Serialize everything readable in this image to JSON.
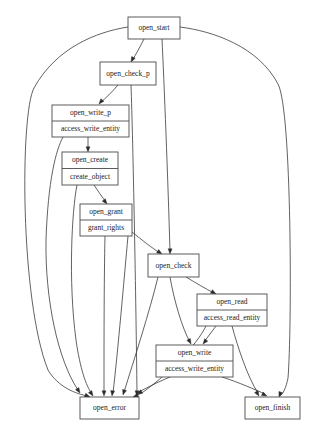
{
  "diagram": {
    "type": "directed-graph",
    "background_color": "#ffffff",
    "edge_color": "#3a3a3a",
    "node_border_color": "#4a4a4a",
    "node_fill_color": "#ffffff",
    "text_color": "#1a1a1a"
  },
  "nodes": [
    {
      "id": "open_start",
      "name": "open_start",
      "rows": [
        "open_start"
      ],
      "x": 128,
      "y": 17,
      "w": 52,
      "h": 22,
      "font_size": 7.5
    },
    {
      "id": "open_check_p",
      "name": "open_check_p",
      "rows": [
        "open_check_p"
      ],
      "x": 100,
      "y": 62,
      "w": 56,
      "h": 23,
      "font_size": 7.5
    },
    {
      "id": "open_write_p",
      "name": "open_write_p",
      "rows": [
        "open_write_p",
        "access_write_entity"
      ],
      "x": 52,
      "y": 105,
      "w": 77,
      "h": 32,
      "font_size": 7.5
    },
    {
      "id": "open_create",
      "name": "open_create",
      "rows": [
        "open_create",
        "create_object"
      ],
      "x": 62,
      "y": 152,
      "w": 56,
      "h": 33,
      "font_size": 7.5
    },
    {
      "id": "open_grant",
      "name": "open_grant",
      "rows": [
        "open_grant",
        "grant_rights"
      ],
      "x": 80,
      "y": 204,
      "w": 52,
      "h": 32,
      "font_size": 7.5
    },
    {
      "id": "open_check",
      "name": "open_check",
      "rows": [
        "open_check"
      ],
      "x": 148,
      "y": 254,
      "w": 51,
      "h": 23,
      "font_size": 7.5
    },
    {
      "id": "open_read",
      "name": "open_read",
      "rows": [
        "open_read",
        "access_read_entity"
      ],
      "x": 197,
      "y": 294,
      "w": 70,
      "h": 32,
      "font_size": 7.5
    },
    {
      "id": "open_write",
      "name": "open_write",
      "rows": [
        "open_write",
        "access_write_entity"
      ],
      "x": 156,
      "y": 345,
      "w": 77,
      "h": 32,
      "font_size": 7.5
    },
    {
      "id": "open_error",
      "name": "open_error",
      "rows": [
        "open_error"
      ],
      "x": 80,
      "y": 397,
      "w": 59,
      "h": 22,
      "font_size": 7.5
    },
    {
      "id": "open_finish",
      "name": "open_finish",
      "rows": [
        "open_finish"
      ],
      "x": 245,
      "y": 397,
      "w": 55,
      "h": 22,
      "font_size": 7.5
    }
  ],
  "edges": [
    {
      "from": "open_start",
      "to": "open_check_p",
      "path": "M 144,39 C 140,47 136,54 132,61",
      "arrow": {
        "x": 131,
        "y": 62,
        "angle": 118
      }
    },
    {
      "from": "open_start",
      "to": "open_error",
      "path": "M 128,27 C 96,32 56,48 34,88 C 20,114 20,300 48,370 C 58,387 76,394 88,396",
      "arrow": {
        "x": 90,
        "y": 397,
        "angle": 20
      }
    },
    {
      "from": "open_start",
      "to": "open_finish",
      "path": "M 180,27 C 212,31 258,46 278,84 C 292,110 292,330 288,378 C 286,388 283,394 280,396",
      "arrow": {
        "x": 279,
        "y": 397,
        "angle": 110
      }
    },
    {
      "from": "open_start",
      "to": "open_check",
      "path": "M 162,39 C 164,80 168,180 170,252",
      "arrow": {
        "x": 170,
        "y": 254,
        "angle": 91
      }
    },
    {
      "from": "open_check_p",
      "to": "open_write_p",
      "path": "M 118,85 C 112,92 106,98 100,103",
      "arrow": {
        "x": 99,
        "y": 104,
        "angle": 130
      }
    },
    {
      "from": "open_check_p",
      "to": "open_error",
      "path": "M 131,85 C 133,140 136,300 137,394",
      "arrow": {
        "x": 137,
        "y": 396,
        "angle": 90
      }
    },
    {
      "from": "open_write_p",
      "to": "open_create",
      "path": "M 88,137 C 88,142 88,146 88,150",
      "arrow": {
        "x": 88,
        "y": 152,
        "angle": 90
      }
    },
    {
      "from": "open_write_p",
      "to": "open_error",
      "path": "M 63,137 C 56,150 48,180 46,240 C 45,300 58,360 78,390",
      "arrow": {
        "x": 80,
        "y": 393,
        "angle": 57
      }
    },
    {
      "from": "open_create",
      "to": "open_grant",
      "path": "M 94,185 C 98,191 102,197 106,202",
      "arrow": {
        "x": 107,
        "y": 204,
        "angle": 52
      }
    },
    {
      "from": "open_create",
      "to": "open_error",
      "path": "M 77,185 C 72,210 68,280 76,340 C 80,368 86,386 92,394",
      "arrow": {
        "x": 93,
        "y": 396,
        "angle": 56
      }
    },
    {
      "from": "open_grant",
      "to": "open_check",
      "path": "M 132,232 C 142,240 152,248 160,253",
      "arrow": {
        "x": 162,
        "y": 254,
        "angle": 33
      }
    },
    {
      "from": "open_grant",
      "to": "open_error",
      "path": "M 105,236 C 104,280 104,350 104,393",
      "arrow": {
        "x": 104,
        "y": 396,
        "angle": 90
      }
    },
    {
      "from": "open_grant",
      "to": "open_error",
      "path": "M 128,236 C 124,280 118,350 113,393",
      "arrow": {
        "x": 112,
        "y": 396,
        "angle": 97
      }
    },
    {
      "from": "open_check",
      "to": "open_read",
      "path": "M 186,277 C 196,283 206,289 214,293",
      "arrow": {
        "x": 216,
        "y": 294,
        "angle": 30
      }
    },
    {
      "from": "open_check",
      "to": "open_write",
      "path": "M 170,277 C 174,300 182,328 190,342",
      "arrow": {
        "x": 191,
        "y": 344,
        "angle": 62
      }
    },
    {
      "from": "open_check",
      "to": "open_error",
      "path": "M 158,277 C 150,310 134,360 124,392",
      "arrow": {
        "x": 123,
        "y": 395,
        "angle": 107
      }
    },
    {
      "from": "open_read",
      "to": "open_write",
      "path": "M 216,326 C 212,331 208,337 204,342",
      "arrow": {
        "x": 203,
        "y": 344,
        "angle": 128
      }
    },
    {
      "from": "open_read",
      "to": "open_finish",
      "path": "M 232,326 C 238,348 248,378 258,393",
      "arrow": {
        "x": 259,
        "y": 396,
        "angle": 58
      }
    },
    {
      "from": "open_read",
      "to": "open_error",
      "path": "M 206,326 C 196,346 170,372 146,390 C 142,393 138,395 135,396",
      "arrow": {
        "x": 133,
        "y": 397,
        "angle": 160
      }
    },
    {
      "from": "open_write",
      "to": "open_error",
      "path": "M 170,377 C 158,382 146,388 139,392",
      "arrow": {
        "x": 137,
        "y": 394,
        "angle": 152
      }
    },
    {
      "from": "open_write",
      "to": "open_finish",
      "path": "M 222,377 C 238,382 256,390 265,394",
      "arrow": {
        "x": 267,
        "y": 396,
        "angle": 25
      }
    }
  ]
}
